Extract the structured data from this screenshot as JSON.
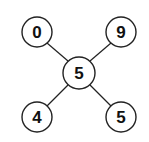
{
  "diagram": {
    "type": "tree",
    "stroke_color": "#222222",
    "background": "#ffffff",
    "center": {
      "label": "5",
      "cx": 79,
      "cy": 73,
      "r": 16
    },
    "leaves": [
      {
        "id": "top-left",
        "label": "0",
        "cx": 37,
        "cy": 32,
        "r": 15
      },
      {
        "id": "top-right",
        "label": "9",
        "cx": 121,
        "cy": 32,
        "r": 15
      },
      {
        "id": "bottom-left",
        "label": "4",
        "cx": 37,
        "cy": 117,
        "r": 15
      },
      {
        "id": "bottom-right",
        "label": "5",
        "cx": 121,
        "cy": 117,
        "r": 15
      }
    ]
  }
}
